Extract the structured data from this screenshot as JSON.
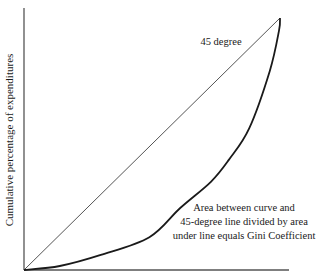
{
  "chart_data": {
    "type": "line",
    "title": "",
    "xlabel": "",
    "ylabel": "Cumulative percentage of expenditures",
    "xlim": [
      0,
      100
    ],
    "ylim": [
      0,
      100
    ],
    "grid": false,
    "series": [
      {
        "name": "45 degree line",
        "x": [
          0,
          100
        ],
        "y": [
          0,
          100
        ],
        "color": "#555555"
      },
      {
        "name": "Lorenz curve",
        "x": [
          0,
          14,
          30,
          49,
          61,
          73,
          80,
          88,
          96,
          99.6,
          100
        ],
        "y": [
          0,
          1.6,
          6,
          13,
          24.6,
          35,
          43.7,
          56.3,
          79,
          95,
          100
        ],
        "color": "#1a1a1a"
      }
    ],
    "annotations": {
      "line_label": "45 degree",
      "gini_note": [
        "Area between curve and",
        "45-degree line divided by area",
        "under line equals Gini Coefficient"
      ]
    }
  }
}
